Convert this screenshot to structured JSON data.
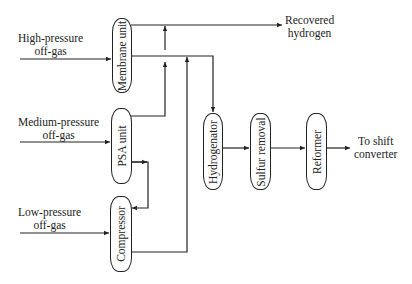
{
  "inputs": {
    "high": [
      "High-pressure",
      "off-gas"
    ],
    "medium": [
      "Medium-pressure",
      "off-gas"
    ],
    "low": [
      "Low-pressure",
      "off-gas"
    ]
  },
  "units": {
    "membrane": "Membrane unit",
    "psa": "PSA unit",
    "compressor": "Compressor",
    "hydrogenator": "Hydrogenator",
    "sulfur": "Sulfur removal",
    "reformer": "Reformer"
  },
  "outputs": {
    "recovered": [
      "Recovered",
      "hydrogen"
    ],
    "shift": [
      "To shift",
      "converter"
    ]
  },
  "colors": {
    "stroke": "#222222",
    "background": "#ffffff"
  }
}
